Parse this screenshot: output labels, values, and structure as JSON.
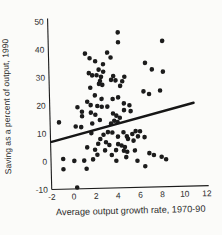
{
  "figure": {
    "background": "#fbfbf9",
    "ink": "#1c1c1c",
    "tick_text_color": "#2b2b2b"
  },
  "chart_data": {
    "type": "scatter",
    "title": "",
    "xlabel": "Average output growth rate, 1970-90",
    "ylabel": "Saving as a percent of output, 1990",
    "xlim": [
      -2,
      12
    ],
    "ylim": [
      -10,
      50
    ],
    "x_ticks": [
      -2,
      0,
      2,
      4,
      6,
      8,
      10,
      12
    ],
    "y_ticks": [
      -10,
      0,
      10,
      20,
      30,
      40,
      50
    ],
    "grid": false,
    "legend": false,
    "marker": {
      "shape": "circle",
      "radius_px": 2.3,
      "color": "#1c1c1c"
    },
    "trend_line": {
      "x1": -1.9,
      "y1": 7.0,
      "x2": 11.0,
      "y2": 19.7,
      "color": "#161616",
      "width_px": 2.4
    },
    "points": [
      [
        4.3,
        45.5
      ],
      [
        4.3,
        42.0
      ],
      [
        8.3,
        42.1
      ],
      [
        1.3,
        38.2
      ],
      [
        3.3,
        38.4
      ],
      [
        1.7,
        36.5
      ],
      [
        3.6,
        36.6
      ],
      [
        2.2,
        35.4
      ],
      [
        6.7,
        34.4
      ],
      [
        2.9,
        34.3
      ],
      [
        2.5,
        32.4
      ],
      [
        7.3,
        32.0
      ],
      [
        8.3,
        31.1
      ],
      [
        1.6,
        31.2
      ],
      [
        2.9,
        31.6
      ],
      [
        1.9,
        30.4
      ],
      [
        2.3,
        30.4
      ],
      [
        2.7,
        29.8
      ],
      [
        3.8,
        30.0
      ],
      [
        4.8,
        29.6
      ],
      [
        2.6,
        28.3
      ],
      [
        3.6,
        28.6
      ],
      [
        4.0,
        28.4
      ],
      [
        4.6,
        28.0
      ],
      [
        2.5,
        27.3
      ],
      [
        2.8,
        26.9
      ],
      [
        1.7,
        26.0
      ],
      [
        4.4,
        26.4
      ],
      [
        6.5,
        24.2
      ],
      [
        8.0,
        24.4
      ],
      [
        7.0,
        23.2
      ],
      [
        2.1,
        23.2
      ],
      [
        2.7,
        21.9
      ],
      [
        3.7,
        21.8
      ],
      [
        4.2,
        22.3
      ],
      [
        1.4,
        21.0
      ],
      [
        1.7,
        19.8
      ],
      [
        2.3,
        19.4
      ],
      [
        2.7,
        19.1
      ],
      [
        3.2,
        19.1
      ],
      [
        4.7,
        20.1
      ],
      [
        5.2,
        19.4
      ],
      [
        0.5,
        19.1
      ],
      [
        0.9,
        17.5
      ],
      [
        0.9,
        15.9
      ],
      [
        4.7,
        17.7
      ],
      [
        5.3,
        17.3
      ],
      [
        1.7,
        17.1
      ],
      [
        2.1,
        16.3
      ],
      [
        3.7,
        16.6
      ],
      [
        4.0,
        15.8
      ],
      [
        4.3,
        15.0
      ],
      [
        3.8,
        14.0
      ],
      [
        4.1,
        13.5
      ],
      [
        2.5,
        14.4
      ],
      [
        -1.2,
        13.9
      ],
      [
        1.8,
        13.2
      ],
      [
        0.3,
        12.3
      ],
      [
        0.8,
        12.0
      ],
      [
        3.5,
        13.0
      ],
      [
        1.7,
        9.8
      ],
      [
        2.8,
        9.1
      ],
      [
        3.2,
        10.0
      ],
      [
        3.6,
        9.8
      ],
      [
        4.6,
        9.8
      ],
      [
        5.4,
        9.1
      ],
      [
        5.7,
        10.1
      ],
      [
        6.1,
        10.0
      ],
      [
        4.1,
        8.3
      ],
      [
        4.9,
        8.3
      ],
      [
        5.0,
        7.4
      ],
      [
        5.9,
        8.2
      ],
      [
        6.5,
        7.9
      ],
      [
        2.5,
        7.6
      ],
      [
        2.3,
        5.9
      ],
      [
        3.0,
        6.4
      ],
      [
        3.3,
        5.4
      ],
      [
        4.1,
        5.6
      ],
      [
        4.4,
        5.1
      ],
      [
        5.5,
        6.7
      ],
      [
        1.3,
        4.7
      ],
      [
        4.7,
        4.5
      ],
      [
        2.0,
        3.8
      ],
      [
        2.9,
        3.5
      ],
      [
        3.9,
        3.5
      ],
      [
        4.6,
        3.2
      ],
      [
        5.6,
        3.2
      ],
      [
        4.9,
        2.8
      ],
      [
        2.2,
        2.0
      ],
      [
        3.5,
        1.8
      ],
      [
        6.9,
        2.1
      ],
      [
        7.3,
        1.4
      ],
      [
        -0.9,
        0.8
      ],
      [
        0.1,
        0.0
      ],
      [
        1.0,
        0.0
      ],
      [
        1.8,
        0.4
      ],
      [
        4.8,
        0.9
      ],
      [
        8.0,
        0.7
      ],
      [
        3.9,
        -0.3
      ],
      [
        5.8,
        -0.5
      ],
      [
        8.4,
        -0.2
      ],
      [
        -0.9,
        -2.9
      ],
      [
        1.2,
        -2.9
      ],
      [
        6.5,
        -2.5
      ],
      [
        0.3,
        -9.5
      ]
    ]
  }
}
